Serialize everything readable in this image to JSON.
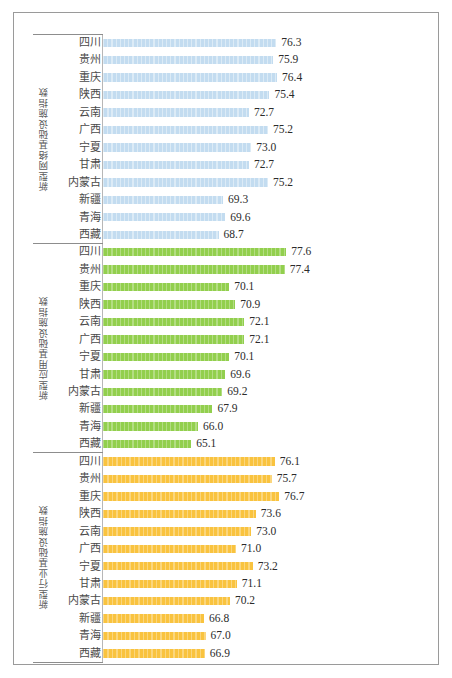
{
  "chart_data": {
    "type": "bar",
    "orientation": "horizontal",
    "title": "",
    "xlabel": "",
    "ylabel": "",
    "grid": false,
    "legend": "none",
    "value_axis_hidden": true,
    "bar_value_labels": true,
    "categories": [
      "四川",
      "贵州",
      "重庆",
      "陕西",
      "云南",
      "广西",
      "宁夏",
      "甘肃",
      "内蒙古",
      "新疆",
      "青海",
      "西藏"
    ],
    "panels": [
      {
        "label": "新型网络基础设施指数",
        "color": "#c3dcf0",
        "values": [
          76.3,
          75.9,
          76.4,
          75.4,
          72.7,
          75.2,
          73.0,
          72.7,
          75.2,
          69.3,
          69.6,
          68.7
        ]
      },
      {
        "label": "新型应用基础设施指数",
        "color": "#92cf4e",
        "values": [
          77.6,
          77.4,
          70.1,
          70.9,
          72.1,
          72.1,
          70.1,
          69.6,
          69.2,
          67.9,
          66.0,
          65.1
        ]
      },
      {
        "label": "新型行业基础设施指数",
        "color": "#f9c33f",
        "values": [
          76.1,
          75.7,
          76.7,
          73.6,
          73.0,
          71.0,
          73.2,
          71.1,
          70.2,
          66.8,
          67.0,
          66.9
        ]
      }
    ],
    "value_labels": {
      "panel_0": [
        "76.3",
        "75.9",
        "76.4",
        "75.4",
        "72.7",
        "75.2",
        "73.0",
        "72.7",
        "75.2",
        "69.3",
        "69.6",
        "68.7"
      ],
      "panel_1": [
        "77.6",
        "77.4",
        "70.1",
        "70.9",
        "72.1",
        "72.1",
        "70.1",
        "69.6",
        "69.2",
        "67.9",
        "66.0",
        "65.1"
      ],
      "panel_2": [
        "76.1",
        "75.7",
        "76.7",
        "73.6",
        "73.0",
        "71.0",
        "73.2",
        "71.1",
        "70.2",
        "66.8",
        "67.0",
        "66.9"
      ]
    },
    "scale": {
      "baseline_value": 53.5,
      "px_per_unit": 7.6
    }
  },
  "colors": {
    "frame": "#9a9a9a",
    "axis": "#b7b7b7",
    "separator": "#8d8d8d",
    "category_text": "#4a4a4a",
    "value_text": "#2b2b2b",
    "panel_label_text": "#5a5a5a"
  }
}
